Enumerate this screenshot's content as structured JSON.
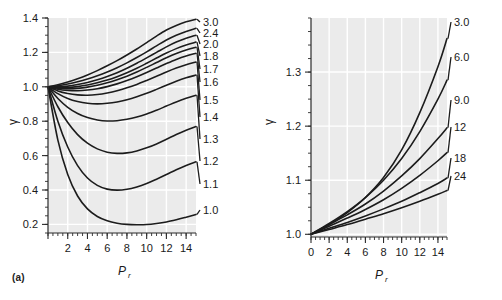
{
  "figure": {
    "background": "#ffffff",
    "plot_background": "#ebebeb",
    "gridline_color": "#ffffff",
    "curve_color": "#1c1c1c",
    "caption_a": "(a)",
    "caption_b": "(b)"
  },
  "chart_data": [
    {
      "type": "line",
      "panel": "a",
      "title": "",
      "xlabel": "P_r",
      "xlabel_main": "P",
      "xlabel_sub": "r",
      "ylabel": "γ",
      "xlim": [
        0,
        15
      ],
      "ylim": [
        0.15,
        1.4
      ],
      "xticks": [
        0,
        2,
        4,
        6,
        8,
        10,
        12,
        14
      ],
      "xtick_labels": [
        "",
        "2",
        "4",
        "6",
        "8",
        "10",
        "12",
        "14"
      ],
      "yticks": [
        0.2,
        0.4,
        0.6,
        0.8,
        1.0,
        1.2,
        1.4
      ],
      "ytick_labels": [
        "0.2",
        "0.4",
        "0.6",
        "0.8",
        "1.0",
        "1.2",
        "1.4"
      ],
      "xminor_step": 0.5,
      "yminor_step": 0.05,
      "grid": true,
      "grid_axis": "both",
      "legend_position": "right-of-curve-ends",
      "series": [
        {
          "name": "3.0",
          "label": "3.0",
          "x": [
            0,
            1,
            2,
            3,
            4,
            5,
            6,
            7,
            8,
            9,
            10,
            11,
            12,
            13,
            14,
            15
          ],
          "values": [
            1.0,
            1.012,
            1.028,
            1.047,
            1.069,
            1.094,
            1.122,
            1.152,
            1.185,
            1.22,
            1.257,
            1.295,
            1.33,
            1.357,
            1.378,
            1.393
          ]
        },
        {
          "name": "2.4",
          "label": "2.4",
          "x": [
            0,
            1,
            2,
            3,
            4,
            5,
            6,
            7,
            8,
            9,
            10,
            11,
            12,
            13,
            14,
            15
          ],
          "values": [
            1.0,
            1.006,
            1.016,
            1.029,
            1.045,
            1.064,
            1.086,
            1.111,
            1.139,
            1.17,
            1.203,
            1.238,
            1.272,
            1.3,
            1.322,
            1.34
          ]
        },
        {
          "name": "2.0",
          "label": "2.0",
          "x": [
            0,
            1,
            2,
            3,
            4,
            5,
            6,
            7,
            8,
            9,
            10,
            11,
            12,
            13,
            14,
            15
          ],
          "values": [
            1.0,
            1.0,
            1.004,
            1.013,
            1.025,
            1.041,
            1.06,
            1.082,
            1.108,
            1.137,
            1.168,
            1.2,
            1.232,
            1.26,
            1.282,
            1.3
          ]
        },
        {
          "name": "1.8",
          "label": "1.8",
          "x": [
            0,
            1,
            2,
            3,
            4,
            5,
            6,
            7,
            8,
            9,
            10,
            11,
            12,
            13,
            14,
            15
          ],
          "values": [
            1.0,
            0.996,
            0.996,
            1.001,
            1.01,
            1.023,
            1.039,
            1.059,
            1.082,
            1.108,
            1.137,
            1.167,
            1.196,
            1.222,
            1.243,
            1.26
          ]
        },
        {
          "name": "1.7",
          "label": "1.7",
          "x": [
            0,
            1,
            2,
            3,
            4,
            5,
            6,
            7,
            8,
            9,
            10,
            11,
            12,
            13,
            14,
            15
          ],
          "values": [
            1.0,
            0.992,
            0.989,
            0.991,
            0.998,
            1.009,
            1.023,
            1.041,
            1.062,
            1.086,
            1.113,
            1.141,
            1.169,
            1.194,
            1.214,
            1.23
          ]
        },
        {
          "name": "1.6",
          "label": "1.6",
          "x": [
            0,
            1,
            2,
            3,
            4,
            5,
            6,
            7,
            8,
            9,
            10,
            11,
            12,
            13,
            14,
            15
          ],
          "values": [
            1.0,
            0.986,
            0.979,
            0.977,
            0.981,
            0.989,
            1.001,
            1.017,
            1.036,
            1.058,
            1.083,
            1.109,
            1.135,
            1.159,
            1.179,
            1.195
          ]
        },
        {
          "name": "1.5",
          "label": "1.5",
          "x": [
            0,
            1,
            2,
            3,
            4,
            5,
            6,
            7,
            8,
            9,
            10,
            11,
            12,
            13,
            14,
            15
          ],
          "values": [
            1.0,
            0.976,
            0.961,
            0.953,
            0.951,
            0.955,
            0.964,
            0.977,
            0.994,
            1.014,
            1.037,
            1.061,
            1.086,
            1.109,
            1.128,
            1.144
          ]
        },
        {
          "name": "1.4",
          "label": "1.4",
          "x": [
            0,
            1,
            2,
            3,
            4,
            5,
            6,
            7,
            8,
            9,
            10,
            11,
            12,
            13,
            14,
            15
          ],
          "values": [
            1.0,
            0.96,
            0.932,
            0.914,
            0.904,
            0.901,
            0.904,
            0.912,
            0.925,
            0.942,
            0.962,
            0.985,
            1.009,
            1.032,
            1.052,
            1.068
          ]
        },
        {
          "name": "1.3",
          "label": "1.3",
          "x": [
            0,
            1,
            2,
            3,
            4,
            5,
            6,
            7,
            8,
            9,
            10,
            11,
            12,
            13,
            14,
            15
          ],
          "values": [
            1.0,
            0.932,
            0.881,
            0.845,
            0.821,
            0.807,
            0.801,
            0.803,
            0.811,
            0.824,
            0.842,
            0.864,
            0.888,
            0.912,
            0.933,
            0.951
          ]
        },
        {
          "name": "1.2",
          "label": "1.2",
          "x": [
            0,
            1,
            2,
            3,
            4,
            5,
            6,
            7,
            8,
            9,
            10,
            11,
            12,
            13,
            14,
            15
          ],
          "values": [
            1.0,
            0.884,
            0.792,
            0.722,
            0.672,
            0.639,
            0.62,
            0.613,
            0.616,
            0.627,
            0.645,
            0.668,
            0.695,
            0.723,
            0.748,
            0.769
          ]
        },
        {
          "name": "1.1",
          "label": "1.1",
          "x": [
            0,
            1,
            2,
            3,
            4,
            5,
            6,
            7,
            8,
            9,
            10,
            11,
            12,
            13,
            14,
            15
          ],
          "values": [
            1.0,
            0.8,
            0.65,
            0.542,
            0.47,
            0.427,
            0.405,
            0.399,
            0.404,
            0.418,
            0.438,
            0.463,
            0.49,
            0.518,
            0.543,
            0.564
          ]
        },
        {
          "name": "1.0",
          "label": "1.0",
          "x": [
            0,
            1,
            2,
            3,
            4,
            5,
            6,
            7,
            8,
            9,
            10,
            11,
            12,
            13,
            14,
            15
          ],
          "values": [
            1.0,
            0.69,
            0.49,
            0.365,
            0.29,
            0.246,
            0.221,
            0.207,
            0.2,
            0.198,
            0.199,
            0.205,
            0.214,
            0.227,
            0.242,
            0.258
          ]
        }
      ]
    },
    {
      "type": "line",
      "panel": "b",
      "title": "",
      "xlabel": "P_r",
      "xlabel_main": "P",
      "xlabel_sub": "r",
      "ylabel": "γ",
      "xlim": [
        0,
        15
      ],
      "ylim": [
        0.995,
        1.4
      ],
      "xticks": [
        0,
        2,
        4,
        6,
        8,
        10,
        12,
        14
      ],
      "xtick_labels": [
        "0",
        "2",
        "4",
        "6",
        "8",
        "10",
        "12",
        "14"
      ],
      "yticks": [
        1.0,
        1.1,
        1.2,
        1.3
      ],
      "ytick_labels": [
        "1.0",
        "1.1",
        "1.2",
        "1.3"
      ],
      "xminor_step": 0.5,
      "yminor_step": 0.025,
      "grid": true,
      "grid_axis": "both",
      "legend_position": "right-of-curve-ends",
      "series": [
        {
          "name": "3.0",
          "label": "3.0",
          "x": [
            0,
            2,
            4,
            6,
            8,
            10,
            12,
            14,
            15
          ],
          "values": [
            1.0,
            1.018,
            1.04,
            1.068,
            1.105,
            1.156,
            1.225,
            1.31,
            1.362
          ]
        },
        {
          "name": "6.0",
          "label": "6.0",
          "x": [
            0,
            2,
            4,
            6,
            8,
            10,
            12,
            14,
            15
          ],
          "values": [
            1.0,
            1.02,
            1.042,
            1.068,
            1.1,
            1.14,
            1.19,
            1.25,
            1.285
          ]
        },
        {
          "name": "9.0",
          "label": "9.0",
          "x": [
            0,
            2,
            4,
            6,
            8,
            10,
            12,
            14,
            15
          ],
          "values": [
            1.0,
            1.018,
            1.036,
            1.056,
            1.08,
            1.108,
            1.14,
            1.177,
            1.197
          ]
        },
        {
          "name": "12",
          "label": "12",
          "x": [
            0,
            2,
            4,
            6,
            8,
            10,
            12,
            14,
            15
          ],
          "values": [
            1.0,
            1.015,
            1.03,
            1.046,
            1.064,
            1.085,
            1.109,
            1.136,
            1.151
          ]
        },
        {
          "name": "18",
          "label": "18",
          "x": [
            0,
            2,
            4,
            6,
            8,
            10,
            12,
            14,
            15
          ],
          "values": [
            1.0,
            1.011,
            1.022,
            1.034,
            1.047,
            1.061,
            1.077,
            1.094,
            1.104
          ]
        },
        {
          "name": "24",
          "label": "24",
          "x": [
            0,
            2,
            4,
            6,
            8,
            10,
            12,
            14,
            15
          ],
          "values": [
            1.0,
            1.009,
            1.018,
            1.028,
            1.038,
            1.049,
            1.061,
            1.074,
            1.081
          ]
        }
      ]
    }
  ]
}
